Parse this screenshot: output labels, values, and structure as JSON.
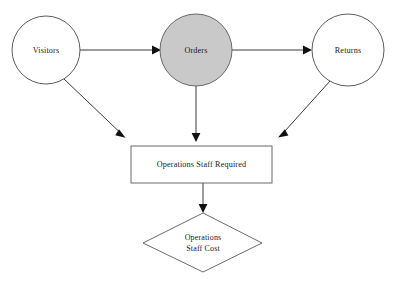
{
  "diagram": {
    "type": "flow-diagram",
    "background_color": "#ffffff",
    "shaded_fill_color": "#c9c9c9",
    "outline_color": "#4a4a4a",
    "arrow_color": "#111111",
    "nodes": [
      {
        "id": "visitors",
        "label": "Visitors",
        "shape": "circle",
        "fill": "white",
        "cx": 46,
        "cy": 50,
        "r": 34
      },
      {
        "id": "orders",
        "label": "Orders",
        "shape": "circle",
        "fill": "shaded",
        "cx": 196,
        "cy": 50,
        "r": 36
      },
      {
        "id": "returns",
        "label": "Returns",
        "shape": "circle",
        "fill": "white",
        "cx": 348,
        "cy": 50,
        "r": 36
      },
      {
        "id": "operations-staff-required",
        "label": "Operations Staff Required",
        "shape": "rectangle",
        "fill": "white",
        "x": 131,
        "y": 146,
        "width": 141,
        "height": 37
      },
      {
        "id": "operations-staff-cost",
        "label_line_1": "Operations",
        "label_line_2": "Staff Cost",
        "shape": "diamond",
        "fill": "white",
        "cx": 203,
        "cy": 243,
        "half_width": 60,
        "half_height": 30
      }
    ],
    "edges": [
      {
        "id": "visitors-to-orders",
        "from": "visitors",
        "to": "orders",
        "style": "straight-arrow"
      },
      {
        "id": "orders-to-returns",
        "from": "orders",
        "to": "returns",
        "style": "straight-arrow"
      },
      {
        "id": "visitors-to-staff-required",
        "from": "visitors",
        "to": "operations-staff-required",
        "style": "diagonal-arrow"
      },
      {
        "id": "orders-to-staff-required",
        "from": "orders",
        "to": "operations-staff-required",
        "style": "vertical-arrow"
      },
      {
        "id": "returns-to-staff-required",
        "from": "returns",
        "to": "operations-staff-required",
        "style": "diagonal-arrow"
      },
      {
        "id": "staff-required-to-staff-cost",
        "from": "operations-staff-required",
        "to": "operations-staff-cost",
        "style": "vertical-arrow"
      }
    ]
  }
}
